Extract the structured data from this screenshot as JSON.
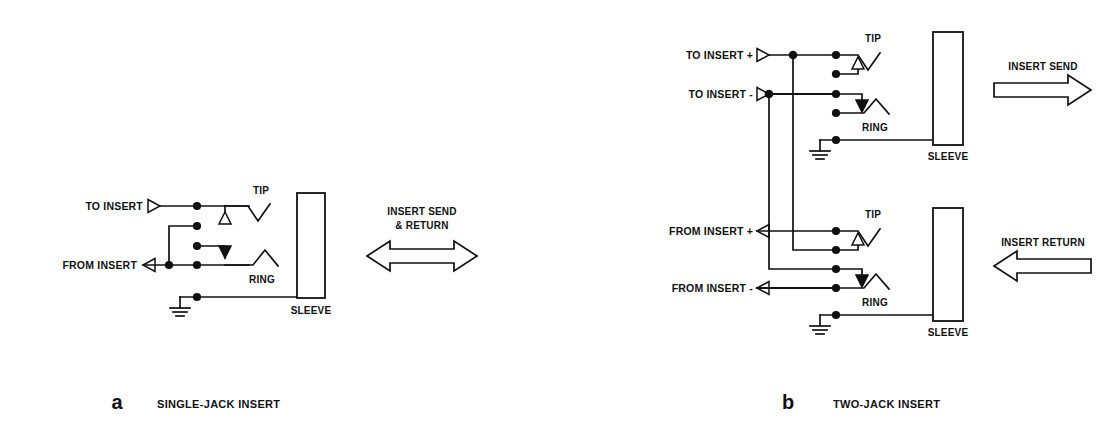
{
  "figure": {
    "background_color": "#ffffff",
    "line_color": "#111111"
  },
  "diagram_a": {
    "caption_letter": "a",
    "caption_text": "SINGLE-JACK INSERT",
    "terminals": [
      {
        "name": "to-insert",
        "label": "TO INSERT",
        "direction": "input"
      },
      {
        "name": "from-insert",
        "label": "FROM INSERT",
        "direction": "output"
      }
    ],
    "jack": {
      "tip_label": "TIP",
      "ring_label": "RING",
      "sleeve_label": "SLEEVE"
    },
    "flow_arrow": {
      "label_line1": "INSERT SEND",
      "label_line2": "& RETURN",
      "type": "double-headed"
    }
  },
  "diagram_b": {
    "caption_letter": "b",
    "caption_text": "TWO-JACK INSERT",
    "send_jack": {
      "terminals": [
        {
          "name": "to-insert-plus",
          "label": "TO INSERT +",
          "direction": "input"
        },
        {
          "name": "to-insert-minus",
          "label": "TO INSERT -",
          "direction": "input"
        }
      ],
      "tip_label": "TIP",
      "ring_label": "RING",
      "sleeve_label": "SLEEVE",
      "flow_arrow": {
        "label": "INSERT SEND",
        "type": "right"
      }
    },
    "return_jack": {
      "terminals": [
        {
          "name": "from-insert-plus",
          "label": "FROM INSERT +",
          "direction": "output"
        },
        {
          "name": "from-insert-minus",
          "label": "FROM INSERT -",
          "direction": "output"
        }
      ],
      "tip_label": "TIP",
      "ring_label": "RING",
      "sleeve_label": "SLEEVE",
      "flow_arrow": {
        "label": "INSERT RETURN",
        "type": "left"
      }
    }
  }
}
